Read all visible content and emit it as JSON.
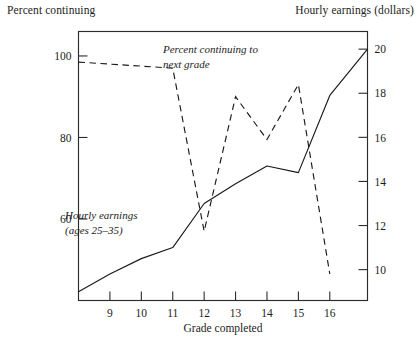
{
  "titles": {
    "left_axis_title": "Percent continuing",
    "right_axis_title": "Hourly earnings (dollars)"
  },
  "axes": {
    "x_label": "Grade completed",
    "x_ticks": [
      "9",
      "10",
      "11",
      "12",
      "13",
      "14",
      "15",
      "16"
    ],
    "y_left_ticks": [
      "100",
      "80",
      "60"
    ],
    "y_right_ticks": [
      "20",
      "18",
      "16",
      "14",
      "12",
      "10"
    ]
  },
  "annotations": {
    "dashed_line_1": "Percent continuing to",
    "dashed_line_2": "next grade",
    "solid_line_1": "Hourly earnings",
    "solid_line_2": "(ages 25–35)"
  },
  "colors": {
    "ink": "#1a1a1a",
    "frame": "#2b2b2b",
    "background": "#ffffff"
  },
  "chart_data": {
    "type": "line",
    "title": "",
    "xlabel": "Grade completed",
    "ylabel": "Percent continuing",
    "ylabel_secondary": "Hourly earnings (dollars)",
    "xlim": [
      8.0,
      17.2
    ],
    "ylim": [
      40,
      106
    ],
    "ylim_secondary": [
      8.6,
      20.8
    ],
    "grid": false,
    "legend": "annotations-inline",
    "x": [
      8,
      9,
      10,
      11,
      12,
      13,
      14,
      15,
      16,
      17.2
    ],
    "series": [
      {
        "name": "Percent continuing to next grade",
        "axis": "left",
        "style": "dashed",
        "units": "percent",
        "x": [
          8,
          9,
          10,
          11,
          12,
          13,
          14,
          15,
          16
        ],
        "values": [
          98.5,
          98.0,
          97.5,
          97.0,
          57.0,
          90.0,
          79.5,
          93.0,
          46.5
        ]
      },
      {
        "name": "Hourly earnings (ages 25-35)",
        "axis": "right",
        "style": "solid",
        "units": "dollars",
        "x": [
          8,
          9,
          10,
          11,
          12,
          13,
          14,
          15,
          16,
          17.2
        ],
        "values": [
          9.0,
          9.8,
          10.5,
          11.0,
          13.0,
          13.9,
          14.7,
          14.4,
          17.9,
          20.0
        ]
      }
    ],
    "x_tick_values": [
      9,
      10,
      11,
      12,
      13,
      14,
      15,
      16
    ],
    "y_left_tick_values": [
      100,
      80,
      60
    ],
    "y_right_tick_values": [
      20,
      18,
      16,
      14,
      12,
      10
    ]
  }
}
